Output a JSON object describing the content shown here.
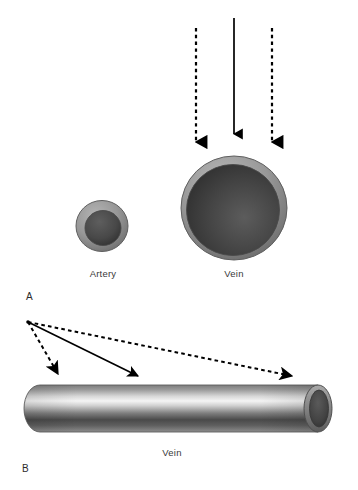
{
  "figure": {
    "background_color": "#ffffff",
    "panels": [
      {
        "id": "panel-a",
        "label": "A",
        "label_x": 26,
        "label_y": 300,
        "description": "Cross sections of an artery and a vein with three downward compression arrows above the vein",
        "structures": [
          {
            "id": "artery-cross-section",
            "label": "Artery",
            "label_x": 103,
            "label_y": 277,
            "center_x": 102,
            "center_y": 226,
            "outer_radius": 26,
            "lumen_radius": 18,
            "wall_color": "#9a9a9a",
            "wall_color_dark": "#6f6f6f",
            "lumen_color": "#4a4a4a",
            "lumen_color_dark": "#2e2e2e",
            "outline_color": "#5a5a5a"
          },
          {
            "id": "vein-cross-section",
            "label": "Vein",
            "label_x": 234,
            "label_y": 277,
            "center_x": 234,
            "center_y": 208,
            "outer_radius": 53,
            "lumen_radius": 46,
            "wall_color": "#9a9a9a",
            "wall_color_dark": "#6f6f6f",
            "lumen_color": "#4a4a4a",
            "lumen_color_dark": "#2a2a2a",
            "outline_color": "#5a5a5a"
          }
        ],
        "arrows": [
          {
            "id": "arrow-left-dashed",
            "style": "dashed",
            "x1": 196,
            "y1": 28,
            "x2": 196,
            "y2": 148,
            "color": "#000000"
          },
          {
            "id": "arrow-center-solid",
            "style": "solid",
            "x1": 234,
            "y1": 18,
            "x2": 234,
            "y2": 140,
            "color": "#000000"
          },
          {
            "id": "arrow-right-dashed",
            "style": "dashed",
            "x1": 272,
            "y1": 28,
            "x2": 272,
            "y2": 148,
            "color": "#000000"
          }
        ]
      },
      {
        "id": "panel-b",
        "label": "B",
        "label_x": 22,
        "label_y": 472,
        "description": "Longitudinal view of a vein as a cylinder with three divergent arrows from one origin",
        "structures": [
          {
            "id": "vein-longitudinal",
            "label": "Vein",
            "label_x": 172,
            "label_y": 456,
            "left_x": 24,
            "right_x": 330,
            "top_y": 385,
            "bottom_y": 432,
            "wall_color": "#9a9a9a",
            "highlight_color": "#f2f2f2",
            "shadow_color": "#3d3d3d",
            "lumen_color": "#4a4a4a",
            "outline_color": "#5a5a5a"
          }
        ],
        "arrows": [
          {
            "id": "arrow-near-dashed",
            "style": "dashed",
            "x1": 28,
            "y1": 322,
            "x2": 64,
            "y2": 382,
            "color": "#000000"
          },
          {
            "id": "arrow-mid-solid",
            "style": "solid",
            "x1": 28,
            "y1": 322,
            "x2": 146,
            "y2": 382,
            "color": "#000000"
          },
          {
            "id": "arrow-far-dashed",
            "style": "dashed",
            "x1": 28,
            "y1": 322,
            "x2": 300,
            "y2": 382,
            "color": "#000000"
          }
        ]
      }
    ]
  }
}
